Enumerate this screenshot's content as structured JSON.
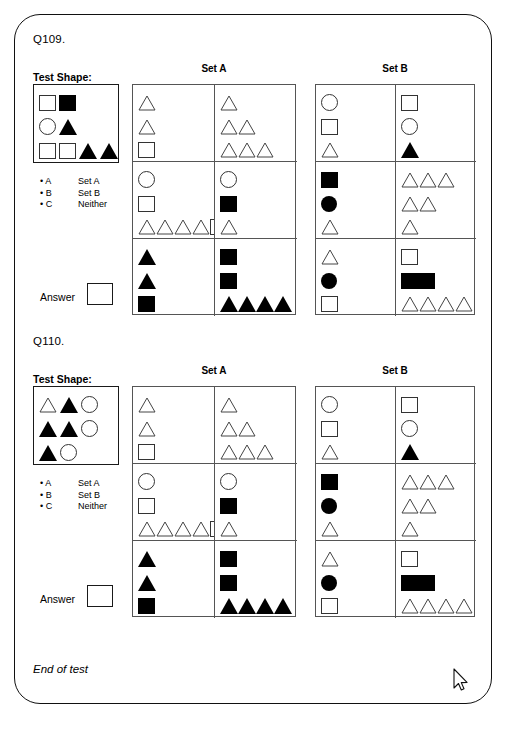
{
  "card": {
    "footer_label": "End of test",
    "cursor_icon": "mouse-pointer-icon"
  },
  "questions": [
    {
      "id": "q109",
      "number_label": "Q109.",
      "test_shape_label": "Test Shape:",
      "set_a_label": "Set A",
      "set_b_label": "Set B",
      "answer_label": "Answer",
      "answer_value": "",
      "options": [
        {
          "bullet": "• A",
          "value": "Set A"
        },
        {
          "bullet": "• B",
          "value": "Set B"
        },
        {
          "bullet": "• C",
          "value": "Neither"
        }
      ],
      "test_shape_rows": [
        [
          "square-outline",
          "square-filled"
        ],
        [
          "circle-outline",
          "triangle-filled"
        ],
        [
          "square-outline",
          "square-outline",
          "triangle-filled",
          "triangle-filled"
        ]
      ],
      "set_a_cells": [
        {
          "cell": "a1",
          "rows": [
            [
              "triangle-outline"
            ],
            [
              "triangle-outline"
            ],
            [
              "square-outline"
            ]
          ]
        },
        {
          "cell": "a2",
          "rows": [
            [
              "triangle-outline"
            ],
            [
              "triangle-outline",
              "triangle-outline"
            ],
            [
              "triangle-outline",
              "triangle-outline",
              "triangle-outline"
            ]
          ]
        },
        {
          "cell": "a3",
          "rows": [
            [
              "circle-outline"
            ],
            [
              "square-outline"
            ],
            [
              "triangle-outline",
              "triangle-outline",
              "triangle-outline",
              "triangle-outline",
              "square-outline"
            ]
          ]
        },
        {
          "cell": "a4",
          "rows": [
            [
              "circle-outline"
            ],
            [
              "square-filled"
            ],
            [
              "triangle-outline"
            ]
          ]
        },
        {
          "cell": "a5",
          "rows": [
            [
              "triangle-filled"
            ],
            [
              "triangle-filled"
            ],
            [
              "square-filled"
            ]
          ]
        },
        {
          "cell": "a6",
          "rows": [
            [
              "square-filled"
            ],
            [
              "square-filled"
            ],
            [
              "triangle-filled",
              "triangle-filled",
              "triangle-filled",
              "triangle-filled"
            ]
          ]
        }
      ],
      "set_b_cells": [
        {
          "cell": "b1",
          "rows": [
            [
              "circle-outline"
            ],
            [
              "square-outline"
            ],
            [
              "triangle-outline"
            ]
          ]
        },
        {
          "cell": "b2",
          "rows": [
            [
              "square-outline"
            ],
            [
              "circle-outline"
            ],
            [
              "triangle-filled"
            ]
          ]
        },
        {
          "cell": "b3",
          "rows": [
            [
              "square-filled"
            ],
            [
              "circle-filled"
            ],
            [
              "triangle-outline"
            ]
          ]
        },
        {
          "cell": "b4",
          "rows": [
            [
              "triangle-outline",
              "triangle-outline",
              "triangle-outline"
            ],
            [
              "triangle-outline",
              "triangle-outline"
            ],
            [
              "triangle-outline"
            ]
          ]
        },
        {
          "cell": "b5",
          "rows": [
            [
              "triangle-outline"
            ],
            [
              "circle-filled"
            ],
            [
              "square-outline"
            ]
          ]
        },
        {
          "cell": "b6",
          "rows": [
            [
              "square-outline"
            ],
            [
              "square-filled",
              "square-filled"
            ],
            [
              "triangle-outline",
              "triangle-outline",
              "triangle-outline",
              "triangle-outline"
            ]
          ]
        }
      ]
    },
    {
      "id": "q110",
      "number_label": "Q110.",
      "test_shape_label": "Test Shape:",
      "set_a_label": "Set A",
      "set_b_label": "Set B",
      "answer_label": "Answer",
      "answer_value": "",
      "options": [
        {
          "bullet": "• A",
          "value": "Set A"
        },
        {
          "bullet": "• B",
          "value": "Set B"
        },
        {
          "bullet": "• C",
          "value": "Neither"
        }
      ],
      "test_shape_rows": [
        [
          "triangle-outline",
          "triangle-filled",
          "circle-outline"
        ],
        [
          "triangle-filled",
          "triangle-filled",
          "circle-outline"
        ],
        [
          "triangle-filled",
          "circle-outline"
        ]
      ],
      "set_a_cells": [
        {
          "cell": "a1",
          "rows": [
            [
              "triangle-outline"
            ],
            [
              "triangle-outline"
            ],
            [
              "square-outline"
            ]
          ]
        },
        {
          "cell": "a2",
          "rows": [
            [
              "triangle-outline"
            ],
            [
              "triangle-outline",
              "triangle-outline"
            ],
            [
              "triangle-outline",
              "triangle-outline",
              "triangle-outline"
            ]
          ]
        },
        {
          "cell": "a3",
          "rows": [
            [
              "circle-outline"
            ],
            [
              "square-outline"
            ],
            [
              "triangle-outline",
              "triangle-outline",
              "triangle-outline",
              "triangle-outline",
              "square-outline"
            ]
          ]
        },
        {
          "cell": "a4",
          "rows": [
            [
              "circle-outline"
            ],
            [
              "square-filled"
            ],
            [
              "triangle-outline"
            ]
          ]
        },
        {
          "cell": "a5",
          "rows": [
            [
              "triangle-filled"
            ],
            [
              "triangle-filled"
            ],
            [
              "square-filled"
            ]
          ]
        },
        {
          "cell": "a6",
          "rows": [
            [
              "square-filled"
            ],
            [
              "square-filled"
            ],
            [
              "triangle-filled",
              "triangle-filled",
              "triangle-filled",
              "triangle-filled"
            ]
          ]
        }
      ],
      "set_b_cells": [
        {
          "cell": "b1",
          "rows": [
            [
              "circle-outline"
            ],
            [
              "square-outline"
            ],
            [
              "triangle-outline"
            ]
          ]
        },
        {
          "cell": "b2",
          "rows": [
            [
              "square-outline"
            ],
            [
              "circle-outline"
            ],
            [
              "triangle-filled"
            ]
          ]
        },
        {
          "cell": "b3",
          "rows": [
            [
              "square-filled"
            ],
            [
              "circle-filled"
            ],
            [
              "triangle-outline"
            ]
          ]
        },
        {
          "cell": "b4",
          "rows": [
            [
              "triangle-outline",
              "triangle-outline",
              "triangle-outline"
            ],
            [
              "triangle-outline",
              "triangle-outline"
            ],
            [
              "triangle-outline"
            ]
          ]
        },
        {
          "cell": "b5",
          "rows": [
            [
              "triangle-outline"
            ],
            [
              "circle-filled"
            ],
            [
              "square-outline"
            ]
          ]
        },
        {
          "cell": "b6",
          "rows": [
            [
              "square-outline"
            ],
            [
              "square-filled",
              "square-filled"
            ],
            [
              "triangle-outline",
              "triangle-outline",
              "triangle-outline",
              "triangle-outline"
            ]
          ]
        }
      ]
    }
  ]
}
